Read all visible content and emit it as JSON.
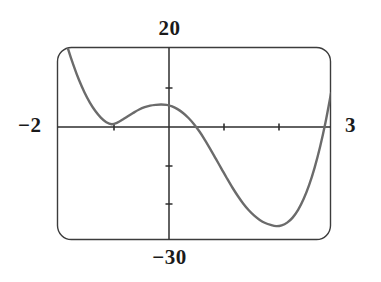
{
  "figure": {
    "kind": "graphing-calculator-window",
    "window": {
      "xmin_label": "−2",
      "xmax_label": "3",
      "ymax_label": "20",
      "ymin_label": "−30"
    },
    "colors": {
      "curve": "#6b6b6b",
      "axis": "#2e2e2e",
      "frame": "#3c3c3c",
      "background": "#ffffff",
      "text": "#1a1a1a"
    }
  },
  "chart_data": {
    "type": "line",
    "title": "",
    "subtitle": "",
    "xlabel": "",
    "ylabel": "",
    "xlim": [
      -2,
      3
    ],
    "ylim": [
      -30,
      20
    ],
    "grid": false,
    "legend": false,
    "legend_position": "none",
    "xticks": [
      -1,
      1,
      2
    ],
    "xtick_labels": [
      "",
      "",
      ""
    ],
    "yticks": [
      10,
      -10,
      -20
    ],
    "ytick_labels": [
      "",
      "",
      ""
    ],
    "axis_labels_shown": {
      "top": "20",
      "bottom": "−30",
      "left": "−2",
      "right": "3"
    },
    "annotations": [],
    "series": [
      {
        "name": "y = f(x)",
        "description": "cubic-like curve with a double root at x = -1, local maximum near x = 0, a simple root near x = 0.7, local minimum near x = 2, rising steeply off the top-right of the window",
        "features": {
          "double_root_x": -1,
          "local_max": [
            0,
            5
          ],
          "simple_root_x": 0.68,
          "local_min": [
            2.02,
            -26.5
          ],
          "y_intercept": 5,
          "enters_top_left_at_x": -1.85,
          "exits_top_right_at_x": 2.9
        },
        "x": [
          -2.0,
          -1.9,
          -1.8,
          -1.7,
          -1.6,
          -1.5,
          -1.4,
          -1.3,
          -1.2,
          -1.1,
          -1.0,
          -0.9,
          -0.8,
          -0.7,
          -0.6,
          -0.5,
          -0.4,
          -0.3,
          -0.2,
          -0.1,
          0.0,
          0.1,
          0.2,
          0.3,
          0.4,
          0.5,
          0.6,
          0.7,
          0.8,
          0.9,
          1.0,
          1.1,
          1.2,
          1.3,
          1.4,
          1.5,
          1.6,
          1.7,
          1.8,
          1.9,
          2.0,
          2.1,
          2.2,
          2.3,
          2.4,
          2.5,
          2.6,
          2.7,
          2.8,
          2.9,
          3.0
        ],
        "y": [
          30.0,
          24.5,
          19.6,
          15.3,
          11.5,
          8.3,
          5.6,
          3.4,
          1.7,
          0.5,
          0.0,
          0.4,
          1.2,
          2.1,
          3.0,
          3.8,
          4.4,
          4.8,
          5.0,
          5.1,
          5.0,
          4.6,
          3.9,
          2.9,
          1.6,
          0.0,
          -1.9,
          -4.1,
          -6.5,
          -9.0,
          -11.5,
          -14.0,
          -16.4,
          -18.6,
          -20.6,
          -22.3,
          -23.7,
          -24.8,
          -25.6,
          -26.1,
          -26.4,
          -26.2,
          -25.5,
          -24.2,
          -22.2,
          -19.4,
          -15.8,
          -11.3,
          -5.9,
          0.5,
          8.0
        ]
      }
    ]
  },
  "geometry": {
    "frame": {
      "x": 57,
      "y": 47,
      "width": 274,
      "height": 193,
      "corner_radius": 14
    },
    "axes": {
      "x_axis_y": 127,
      "y_axis_x": 169
    },
    "px_per_x_unit": 54.8,
    "px_per_y_unit": 3.86
  }
}
